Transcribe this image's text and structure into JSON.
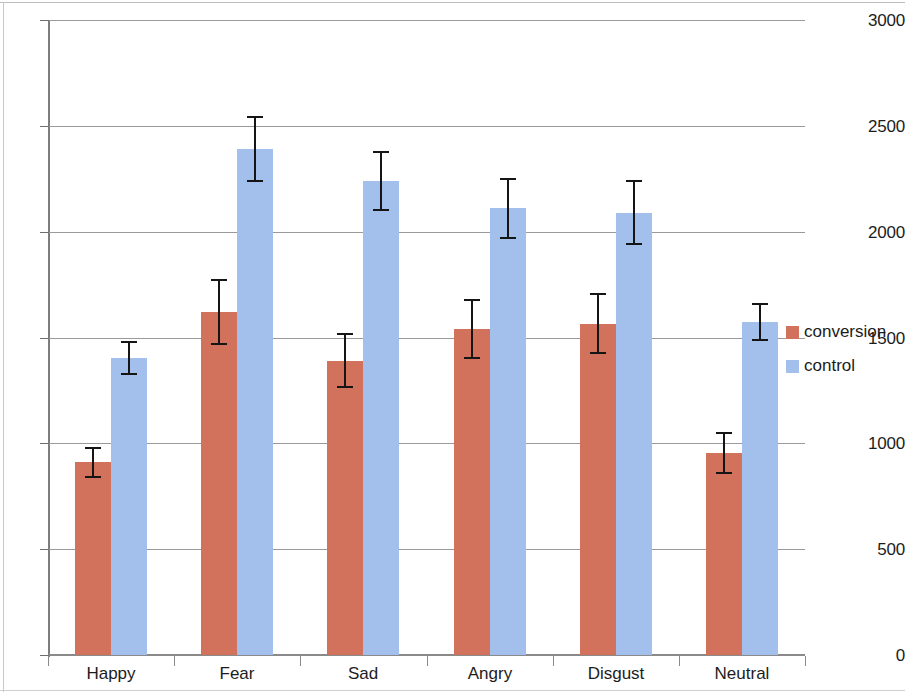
{
  "chart_data": {
    "type": "bar",
    "title": "",
    "subtitle": "",
    "xlabel": "",
    "ylabel": "",
    "categories": [
      "Happy",
      "Fear",
      "Sad",
      "Angry",
      "Disgust",
      "Neutral"
    ],
    "series": [
      {
        "name": "conversion",
        "color": "#d2715c",
        "values": [
          910,
          1620,
          1390,
          1540,
          1565,
          955
        ],
        "errors": [
          75,
          155,
          130,
          140,
          145,
          100
        ]
      },
      {
        "name": "control",
        "color": "#a3c0ec",
        "values": [
          1405,
          2390,
          2240,
          2110,
          2090,
          1575
        ],
        "errors": [
          80,
          155,
          140,
          145,
          155,
          90
        ]
      }
    ],
    "ylim": [
      0,
      3000
    ],
    "yticks": [
      0,
      500,
      1000,
      1500,
      2000,
      2500,
      3000
    ],
    "ytick_labels": [
      "0",
      "500",
      "1000",
      "1500",
      "2000",
      "2500",
      "3000"
    ],
    "grid": true,
    "grid_axis": "y",
    "legend_position": "right",
    "legend_entries": [
      "conversion",
      "control"
    ],
    "error_bar_style": "capped"
  },
  "axes": {
    "y_axis_name": "y-axis",
    "x_axis_name": "x-axis"
  }
}
